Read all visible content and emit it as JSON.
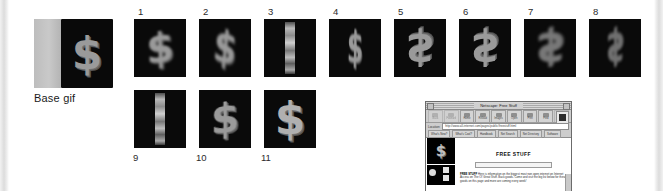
{
  "figure": {
    "base": {
      "label": "Base gif",
      "symbol": "$"
    },
    "frames_row1": [
      {
        "number": "1",
        "symbol": "$",
        "style": "blurA"
      },
      {
        "number": "2",
        "symbol": "$",
        "style": "blurB"
      },
      {
        "number": "3",
        "symbol": "",
        "style": "squeeze"
      },
      {
        "number": "4",
        "symbol": "$",
        "style": "blurB"
      },
      {
        "number": "5",
        "symbol": "$",
        "style": "blurA"
      },
      {
        "number": "6",
        "symbol": "$",
        "style": "blurA"
      },
      {
        "number": "7",
        "symbol": "$",
        "style": "blurB"
      },
      {
        "number": "8",
        "symbol": "$",
        "style": "blurC"
      }
    ],
    "frames_row2": [
      {
        "number": "9",
        "symbol": "",
        "style": "squeeze"
      },
      {
        "number": "10",
        "symbol": "$",
        "style": "blurA"
      },
      {
        "number": "11",
        "symbol": "$",
        "style": "blurA"
      }
    ]
  },
  "browser": {
    "title": "Netscape: Free Stuff",
    "toolbar_buttons": [
      {
        "label": "Back"
      },
      {
        "label": "Forward"
      },
      {
        "label": "Home"
      },
      {
        "label": "Reload"
      },
      {
        "label": "Images"
      },
      {
        "label": "Open"
      },
      {
        "label": "Print"
      },
      {
        "label": "Find"
      },
      {
        "label": "Stop"
      }
    ],
    "logo_icon": "netscape-logo-icon",
    "location_label": "Location:",
    "location_value": "http://www.all-internet.com/pages/public/freestuff.html",
    "directory_buttons": [
      {
        "label": "What's New?"
      },
      {
        "label": "What's Cool?"
      },
      {
        "label": "Handbook"
      },
      {
        "label": "Net Search"
      },
      {
        "label": "Net Directory"
      },
      {
        "label": "Software"
      }
    ],
    "page": {
      "banner_symbol": "$",
      "heading": "FREE STUFF",
      "paragraph_lead": "FREE  STUFF",
      "paragraph_text": " Here is information on the biggest most non open internet on Internet Access on The Ol' Great Stuff. Back goods. Come and visit the big list below for these goods on this page and more are coming every week!",
      "link_text": "Internet Access"
    }
  }
}
